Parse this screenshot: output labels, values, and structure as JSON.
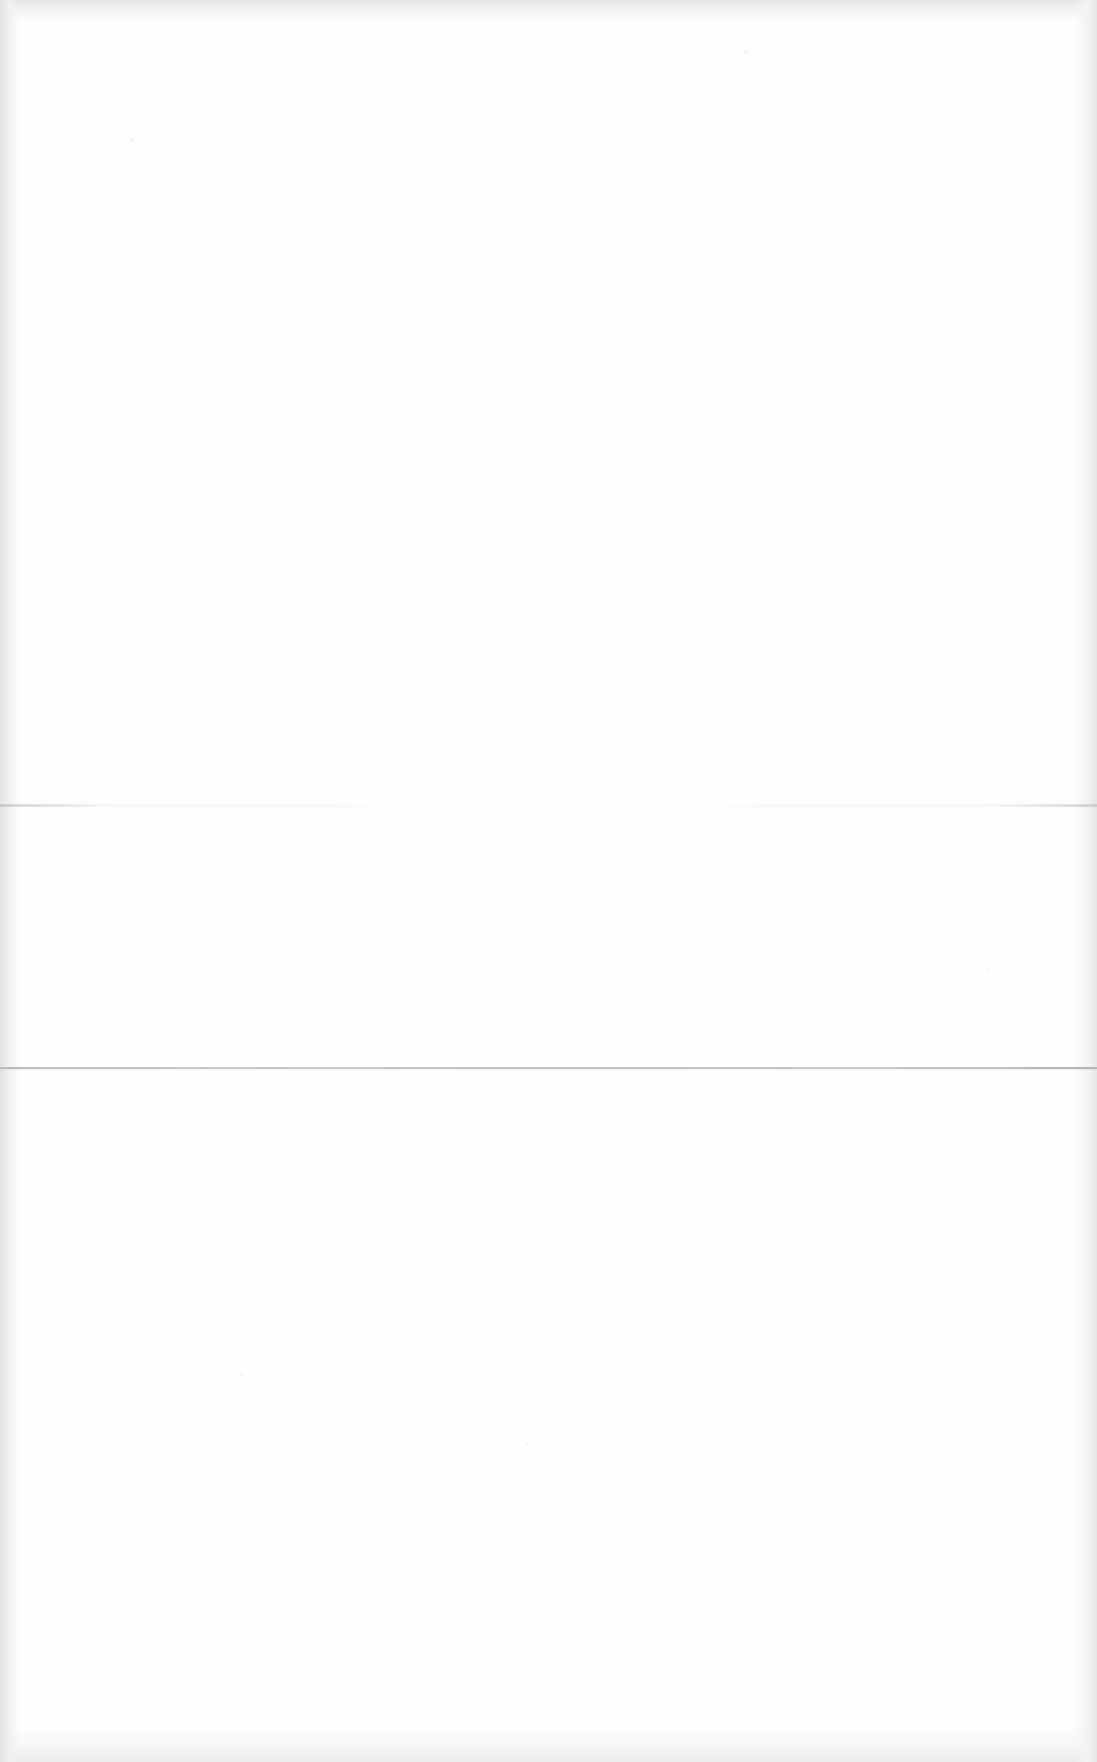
{
  "document": {
    "type": "scanned blank page",
    "text_content": "",
    "background_color": "#fefefe",
    "edge_shadow_color": "#e4e4e4",
    "fold_lines": [
      {
        "name": "upper-fold",
        "y": 805,
        "color": "#d8d8d8"
      },
      {
        "name": "lower-fold",
        "y": 1068,
        "color": "#c2c2c2"
      }
    ]
  }
}
